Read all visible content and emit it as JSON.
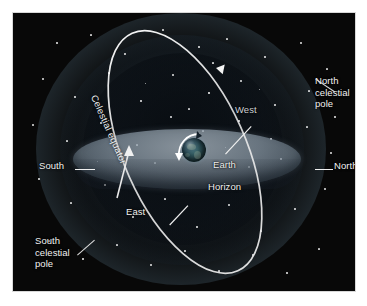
{
  "figure": {
    "background_color": "#ffffff",
    "panel_color": "#080808"
  },
  "labels": {
    "north_celestial_pole": "North\ncelestial\npole",
    "south_celestial_pole": "South\ncelestial\npole",
    "south": "South",
    "north": "North",
    "west": "West",
    "east": "East",
    "earth": "Earth",
    "horizon": "Horizon",
    "celestial_equator": "Celestial equator"
  },
  "elements": {
    "sphere": "celestial-sphere-glow",
    "horizon_plane": "horizon-plane-ellipse",
    "equator_ring": "celestial-equator-ring",
    "earth_globe": "earth-globe",
    "rotation_arrow": "earth-rotation-arrow",
    "ring_arrow_top": "equator-direction-arrow-top",
    "ring_arrow_lower": "equator-direction-arrow-lower"
  },
  "colors": {
    "glow": "#7b9bb0",
    "horizon": "#8c9ba8",
    "ring": "#f2f2f2",
    "label": "#f2f2f2",
    "earth_ocean": "#2b5058",
    "earth_land": "#96aa96"
  },
  "stars": [
    {
      "x": 44,
      "y": 30,
      "r": 0.8
    },
    {
      "x": 78,
      "y": 22,
      "r": 0.6
    },
    {
      "x": 112,
      "y": 41,
      "r": 0.9
    },
    {
      "x": 150,
      "y": 17,
      "r": 0.7
    },
    {
      "x": 186,
      "y": 34,
      "r": 1.0
    },
    {
      "x": 214,
      "y": 26,
      "r": 0.6
    },
    {
      "x": 252,
      "y": 44,
      "r": 0.8
    },
    {
      "x": 288,
      "y": 30,
      "r": 0.7
    },
    {
      "x": 314,
      "y": 56,
      "r": 0.6
    },
    {
      "x": 30,
      "y": 66,
      "r": 0.7
    },
    {
      "x": 62,
      "y": 84,
      "r": 1.0
    },
    {
      "x": 96,
      "y": 60,
      "r": 0.6
    },
    {
      "x": 128,
      "y": 88,
      "r": 0.8
    },
    {
      "x": 160,
      "y": 62,
      "r": 0.7
    },
    {
      "x": 196,
      "y": 80,
      "r": 1.1
    },
    {
      "x": 228,
      "y": 68,
      "r": 0.7
    },
    {
      "x": 262,
      "y": 92,
      "r": 0.9
    },
    {
      "x": 296,
      "y": 78,
      "r": 0.6
    },
    {
      "x": 322,
      "y": 104,
      "r": 0.8
    },
    {
      "x": 20,
      "y": 112,
      "r": 0.7
    },
    {
      "x": 54,
      "y": 128,
      "r": 0.6
    },
    {
      "x": 88,
      "y": 110,
      "r": 0.8
    },
    {
      "x": 124,
      "y": 132,
      "r": 0.6
    },
    {
      "x": 158,
      "y": 104,
      "r": 0.7
    },
    {
      "x": 190,
      "y": 118,
      "r": 0.6
    },
    {
      "x": 226,
      "y": 108,
      "r": 0.9
    },
    {
      "x": 258,
      "y": 126,
      "r": 0.7
    },
    {
      "x": 294,
      "y": 114,
      "r": 0.6
    },
    {
      "x": 318,
      "y": 140,
      "r": 0.7
    },
    {
      "x": 26,
      "y": 166,
      "r": 0.8
    },
    {
      "x": 58,
      "y": 190,
      "r": 0.6
    },
    {
      "x": 92,
      "y": 172,
      "r": 0.7
    },
    {
      "x": 120,
      "y": 204,
      "r": 0.9
    },
    {
      "x": 152,
      "y": 186,
      "r": 0.6
    },
    {
      "x": 184,
      "y": 214,
      "r": 0.8
    },
    {
      "x": 216,
      "y": 192,
      "r": 0.7
    },
    {
      "x": 248,
      "y": 218,
      "r": 0.6
    },
    {
      "x": 282,
      "y": 196,
      "r": 0.9
    },
    {
      "x": 312,
      "y": 176,
      "r": 0.7
    },
    {
      "x": 36,
      "y": 228,
      "r": 0.6
    },
    {
      "x": 70,
      "y": 246,
      "r": 0.8
    },
    {
      "x": 104,
      "y": 232,
      "r": 0.6
    },
    {
      "x": 138,
      "y": 252,
      "r": 0.7
    },
    {
      "x": 172,
      "y": 238,
      "r": 0.9
    },
    {
      "x": 206,
      "y": 258,
      "r": 0.6
    },
    {
      "x": 240,
      "y": 242,
      "r": 0.7
    },
    {
      "x": 274,
      "y": 260,
      "r": 0.8
    },
    {
      "x": 306,
      "y": 236,
      "r": 0.6
    },
    {
      "x": 142,
      "y": 150,
      "r": 0.6
    },
    {
      "x": 236,
      "y": 154,
      "r": 0.7
    },
    {
      "x": 108,
      "y": 158,
      "r": 0.5
    },
    {
      "x": 268,
      "y": 146,
      "r": 0.6
    },
    {
      "x": 200,
      "y": 50,
      "r": 0.6
    },
    {
      "x": 132,
      "y": 70,
      "r": 0.5
    },
    {
      "x": 246,
      "y": 76,
      "r": 0.5
    },
    {
      "x": 84,
      "y": 148,
      "r": 0.5
    },
    {
      "x": 176,
      "y": 96,
      "r": 0.6
    },
    {
      "x": 212,
      "y": 134,
      "r": 0.5
    }
  ]
}
